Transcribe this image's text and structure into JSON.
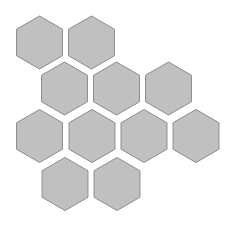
{
  "canvas": {
    "width": 232,
    "height": 225,
    "background": "#ffffff"
  },
  "style": {
    "hex_fill": "#c0c0c0",
    "hex_stroke": "#8c8c8c",
    "hex_radius": 26.5,
    "orientation": "pointy-top"
  },
  "hexagons": [
    {
      "row": 1,
      "col": 1,
      "cx": 39.5,
      "cy": 42.5
    },
    {
      "row": 1,
      "col": 2,
      "cx": 91.5,
      "cy": 42.5
    },
    {
      "row": 2,
      "col": 1,
      "cx": 64.5,
      "cy": 88.5
    },
    {
      "row": 2,
      "col": 2,
      "cx": 116.5,
      "cy": 88.5
    },
    {
      "row": 2,
      "col": 3,
      "cx": 168.5,
      "cy": 88.5
    },
    {
      "row": 3,
      "col": 1,
      "cx": 39.5,
      "cy": 136
    },
    {
      "row": 3,
      "col": 2,
      "cx": 92,
      "cy": 136
    },
    {
      "row": 3,
      "col": 3,
      "cx": 144,
      "cy": 136
    },
    {
      "row": 3,
      "col": 4,
      "cx": 196,
      "cy": 136
    },
    {
      "row": 4,
      "col": 1,
      "cx": 65,
      "cy": 184
    },
    {
      "row": 4,
      "col": 2,
      "cx": 117,
      "cy": 184
    }
  ]
}
